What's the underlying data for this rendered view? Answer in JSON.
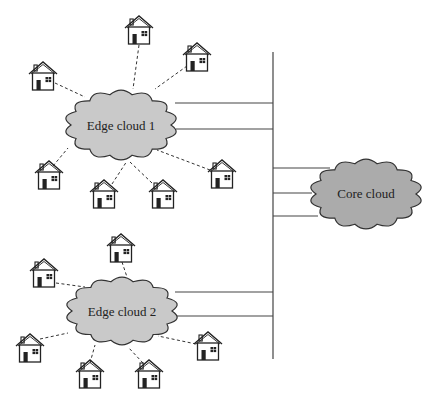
{
  "diagram": {
    "type": "network-topology",
    "bus": {
      "name": "backbone"
    },
    "clouds": [
      {
        "id": "edge1",
        "label": "Edge cloud 1",
        "fill": "#c9c9c9",
        "links_to_bus": 2
      },
      {
        "id": "edge2",
        "label": "Edge cloud 2",
        "fill": "#c9c9c9",
        "links_to_bus": 2
      },
      {
        "id": "core",
        "label": "Core cloud",
        "fill": "#ababab",
        "links_to_bus": 3
      }
    ],
    "houses": [
      {
        "cloud": "edge1",
        "count": 7
      },
      {
        "cloud": "edge2",
        "count": 6
      }
    ],
    "colors": {
      "stroke": "#222222",
      "background": "#ffffff"
    }
  }
}
